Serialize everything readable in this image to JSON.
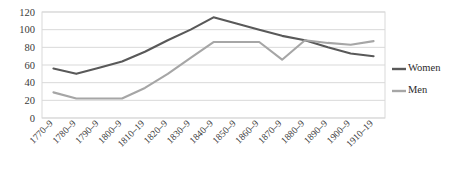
{
  "chart_data": {
    "type": "line",
    "title": "",
    "xlabel": "",
    "ylabel": "",
    "ylim": [
      0,
      120
    ],
    "ytick_values": [
      0,
      20,
      40,
      60,
      80,
      100,
      120
    ],
    "grid": true,
    "legend_position": "right",
    "categories": [
      "1770–9",
      "1780–9",
      "1790–9",
      "1800–9",
      "1810–19",
      "1820–9",
      "1830–9",
      "1840–9",
      "1850–9",
      "1860–9",
      "1870–9",
      "1880–9",
      "1890–9",
      "1900–9",
      "1910–19"
    ],
    "series": [
      {
        "name": "Women",
        "color": "#595959",
        "values": [
          56,
          50,
          57,
          64,
          75,
          88,
          100,
          114,
          107,
          100,
          93,
          88,
          80,
          73,
          70
        ]
      },
      {
        "name": "Men",
        "color": "#a6a6a6",
        "values": [
          29,
          22,
          22,
          22,
          34,
          50,
          68,
          86,
          86,
          86,
          66,
          88,
          85,
          83,
          87
        ]
      }
    ]
  },
  "legend": {
    "items": [
      {
        "label": "Women",
        "color": "#595959"
      },
      {
        "label": "Men",
        "color": "#a6a6a6"
      }
    ]
  },
  "axes": {
    "y_ticks": [
      "0",
      "20",
      "40",
      "60",
      "80",
      "100",
      "120"
    ],
    "x_ticks": [
      "1770–9",
      "1780–9",
      "1790–9",
      "1800–9",
      "1810–19",
      "1820–9",
      "1830–9",
      "1840–9",
      "1850–9",
      "1860–9",
      "1870–9",
      "1880–9",
      "1890–9",
      "1900–9",
      "1910–19"
    ]
  }
}
